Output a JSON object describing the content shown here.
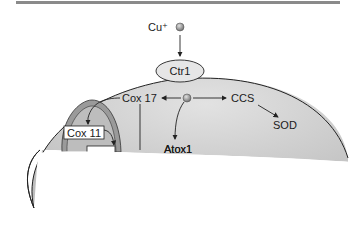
{
  "diagram": {
    "ion": "Cu⁺",
    "transporter": "Ctr1",
    "chaperones": {
      "cox17": "Cox 17",
      "ccs": "CCS",
      "atox1": "Atox1",
      "cox11": "Cox 11",
      "partial_label": "SCO"
    },
    "targets": {
      "sod": "SOD"
    },
    "colors": {
      "cell_fill": "#c9c9c9",
      "mito_fill": "#9a9a9a",
      "mito_inner": "#bdbdbd",
      "copper_ion": "#a8a8a8",
      "top_bar": "#8a8a8a"
    }
  }
}
